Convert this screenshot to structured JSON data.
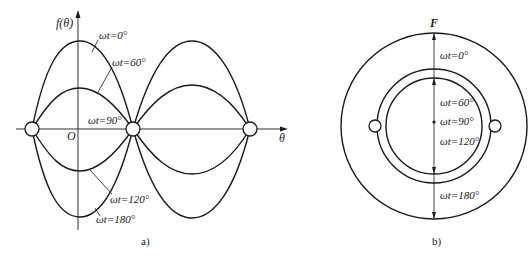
{
  "figure_a": {
    "caption": "a)",
    "y_axis_label": "f(θ)",
    "x_axis_label": "θ",
    "origin_label": "O",
    "curve_labels": [
      {
        "text": "ωt=0°"
      },
      {
        "text": "ωt=60°"
      },
      {
        "text": "ωt=90°"
      },
      {
        "text": "ωt=120°"
      },
      {
        "text": "ωt=180°"
      }
    ]
  },
  "figure_b": {
    "caption": "b)",
    "force_label": "F",
    "position_labels": [
      {
        "text": "ωt=0°"
      },
      {
        "text": "ωt=60°"
      },
      {
        "text": "ωt=90°"
      },
      {
        "text": "ωt=120°"
      },
      {
        "text": "ωt=180°"
      }
    ]
  },
  "colors": {
    "ink": "#1a1a1a",
    "background": "#ffffff"
  }
}
